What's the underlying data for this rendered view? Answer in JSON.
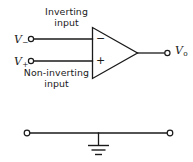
{
  "figure": {
    "background_color": "#ffffff",
    "line_color": "#1a1a1a",
    "width": 193,
    "height": 162
  },
  "opamp": {
    "labels": {
      "inverting_input": "Inverting\ninput",
      "inverting_input_line1": "Inverting",
      "inverting_input_line2": "input",
      "noninverting_input_line1": "Non-inverting",
      "noninverting_input_line2": "input",
      "minus_sign": "−",
      "plus_sign": "+"
    },
    "terminals": {
      "inverting": {
        "symbol": "V",
        "subscript": "−"
      },
      "noninverting": {
        "symbol": "V",
        "subscript": "+"
      },
      "output": {
        "symbol": "V",
        "subscript": "o"
      }
    }
  },
  "ground_network": {
    "name": "ground-rail",
    "left_terminal": "open-circle",
    "right_terminal": "open-circle",
    "symbol": "earth-ground"
  }
}
